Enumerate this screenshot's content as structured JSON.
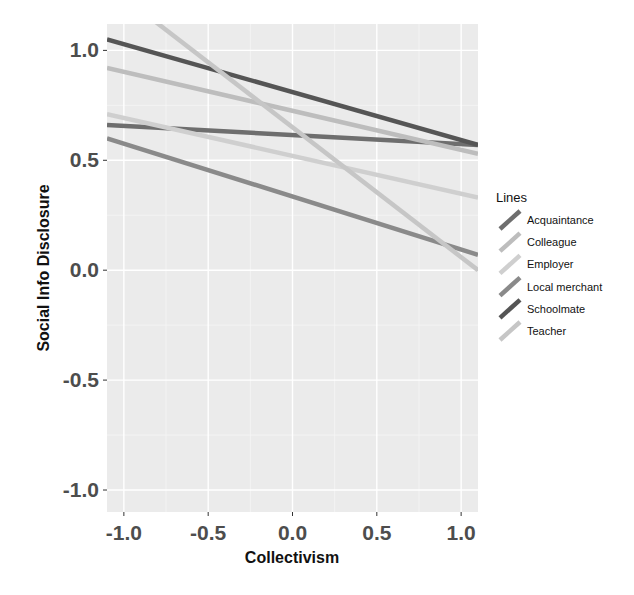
{
  "chart_data": {
    "type": "line",
    "title": "",
    "xlabel": "Collectivism",
    "ylabel": "Social Info Disclosure",
    "xlim": [
      -1.1,
      1.1
    ],
    "ylim": [
      -1.1,
      1.12
    ],
    "xticks": [
      -1.0,
      -0.5,
      0.0,
      0.5,
      1.0
    ],
    "xtick_labels": [
      "-1.0",
      "-0.5",
      "0.0",
      "0.5",
      "1.0"
    ],
    "yticks": [
      1.0,
      0.5,
      0.0,
      -0.5,
      -1.0
    ],
    "ytick_labels": [
      "1.0",
      "0.5",
      "0.0",
      "-0.5",
      "-1.0"
    ],
    "grid": true,
    "legend_title": "Lines",
    "legend_position": "right",
    "x": [
      -1.1,
      1.1
    ],
    "series": [
      {
        "name": "Acquaintance",
        "values": [
          0.66,
          0.57
        ],
        "color": "#6e6e6e"
      },
      {
        "name": "Colleague",
        "values": [
          0.92,
          0.53
        ],
        "color": "#bdbdbd"
      },
      {
        "name": "Employer",
        "values": [
          0.71,
          0.33
        ],
        "color": "#cfcfcf"
      },
      {
        "name": "Local merchant",
        "values": [
          0.6,
          0.07
        ],
        "color": "#8a8a8a"
      },
      {
        "name": "Schoolmate",
        "values": [
          1.05,
          0.57
        ],
        "color": "#555555"
      },
      {
        "name": "Teacher",
        "values": [
          1.3,
          0.0
        ],
        "color": "#c6c6c6"
      }
    ]
  },
  "panel_bg": "#ebebeb",
  "grid_color": "#ffffff"
}
